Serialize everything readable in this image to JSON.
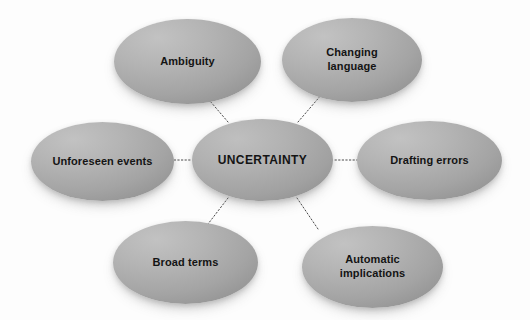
{
  "diagram": {
    "type": "concept-map",
    "title": "UNCERTAINTY",
    "background_color": "#fdfdfd",
    "node_fill_light": "#c2c2c2",
    "node_fill_dark": "#878787",
    "text_color": "#141414",
    "connector_color": "#4a4a4a",
    "connector_style": "dotted",
    "center": {
      "label": "UNCERTAINTY",
      "x": 192,
      "y": 119,
      "width": 141,
      "height": 82
    },
    "nodes": [
      {
        "id": "ambiguity",
        "label": "Ambiguity",
        "x": 114,
        "y": 19,
        "width": 147,
        "height": 85,
        "position": "top-left"
      },
      {
        "id": "changing-language",
        "label": "Changing\nlanguage",
        "x": 282,
        "y": 18,
        "width": 140,
        "height": 84,
        "position": "top-right"
      },
      {
        "id": "unforeseen-events",
        "label": "Unforeseen events",
        "x": 31,
        "y": 122,
        "width": 143,
        "height": 79,
        "position": "left"
      },
      {
        "id": "drafting-errors",
        "label": "Drafting errors",
        "x": 357,
        "y": 121,
        "width": 145,
        "height": 79,
        "position": "right"
      },
      {
        "id": "broad-terms",
        "label": "Broad terms",
        "x": 113,
        "y": 221,
        "width": 145,
        "height": 83,
        "position": "bottom-left"
      },
      {
        "id": "automatic-implications",
        "label": "Automatic\nimplications",
        "x": 302,
        "y": 226,
        "width": 141,
        "height": 82,
        "position": "bottom-right"
      }
    ],
    "connectors": [
      {
        "id": "center-to-ambiguity",
        "from": "center",
        "to": "ambiguity",
        "x1": 228,
        "y1": 122,
        "x2": 204,
        "y2": 94
      },
      {
        "id": "center-to-changing-language",
        "from": "center",
        "to": "changing-language",
        "x1": 298,
        "y1": 122,
        "x2": 322,
        "y2": 94
      },
      {
        "id": "center-to-unforeseen-events",
        "from": "center",
        "to": "unforeseen-events",
        "x1": 190,
        "y1": 160,
        "x2": 172,
        "y2": 160
      },
      {
        "id": "center-to-drafting-errors",
        "from": "center",
        "to": "drafting-errors",
        "x1": 335,
        "y1": 160,
        "x2": 358,
        "y2": 160
      },
      {
        "id": "center-to-broad-terms",
        "from": "center",
        "to": "broad-terms",
        "x1": 228,
        "y1": 198,
        "x2": 208,
        "y2": 224
      },
      {
        "id": "center-to-automatic-implications",
        "from": "center",
        "to": "automatic-implications",
        "x1": 297,
        "y1": 198,
        "x2": 318,
        "y2": 229
      }
    ]
  }
}
